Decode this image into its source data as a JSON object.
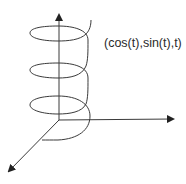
{
  "diagram": {
    "curve_label": "(cos(t),sin(t),t)",
    "colors": {
      "stroke": "#3a3a3a",
      "background": "#ffffff",
      "text": "#2a2a2a"
    },
    "axes": [
      {
        "name": "z-axis",
        "direction": "up"
      },
      {
        "name": "y-axis",
        "direction": "right"
      },
      {
        "name": "x-axis",
        "direction": "down-left"
      }
    ],
    "helix_turns": 3
  }
}
